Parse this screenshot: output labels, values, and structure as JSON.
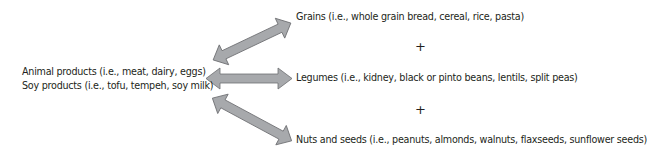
{
  "diagram": {
    "left": {
      "line1": "Animal products (i.e., meat, dairy, eggs)",
      "line2": "Soy products (i.e., tofu, tempeh, soy milk)"
    },
    "right": [
      {
        "label": "Grains (i.e., whole grain bread, cereal, rice, pasta)"
      },
      {
        "label": "Legumes (i.e., kidney, black or pinto beans, lentils, split peas)"
      },
      {
        "label": "Nuts and seeds (i.e., peanuts, almonds, walnuts, flaxseeds, sunflower seeds)"
      }
    ],
    "connectors": [
      "+",
      "+"
    ],
    "arrow_fill": "#a7a9ac",
    "arrow_stroke": "#6d6e71"
  }
}
